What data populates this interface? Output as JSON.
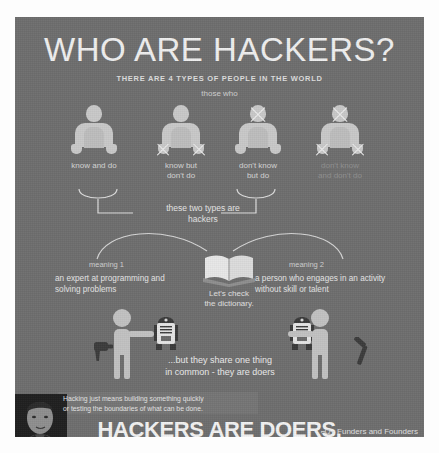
{
  "poster": {
    "background_color": "#6e6e6e",
    "text_color": "#e6e6e6",
    "title": "WHO ARE HACKERS?",
    "subtitle": "THERE ARE 4 TYPES OF PEOPLE IN THE WORLD",
    "intro": "those who"
  },
  "people": [
    {
      "label_line1": "know and do",
      "label_line2": "",
      "head_crossed": false,
      "hands_crossed": false,
      "dim": false
    },
    {
      "label_line1": "know but",
      "label_line2": "don't do",
      "head_crossed": false,
      "hands_crossed": true,
      "dim": false
    },
    {
      "label_line1": "don't know",
      "label_line2": "but do",
      "head_crossed": true,
      "hands_crossed": false,
      "dim": false
    },
    {
      "label_line1": "don't know",
      "label_line2": "and don't do",
      "head_crossed": true,
      "hands_crossed": true,
      "dim": true
    }
  ],
  "bracket": {
    "label_line1": "these two types are",
    "label_line2": "hackers"
  },
  "dictionary": {
    "caption_line1": "Let's check",
    "caption_line2": "the dictionary.",
    "meaning1_title": "meaning 1",
    "meaning1_body": "an expert at programming and solving problems",
    "meaning2_title": "meaning 2",
    "meaning2_body": "a person who engages in an activity without skill or talent"
  },
  "doers": {
    "line1": "...but they share one thing",
    "line2": "in common - they are doers",
    "left_tool": "drill-icon",
    "right_tool": "hammer-icon",
    "robot_icon": "robot-icon"
  },
  "footer": {
    "quote_line1": "Hacking just means building something quickly",
    "quote_line2": "or testing the boundaries of what can be done.",
    "headline": "HACKERS ARE DOERS.",
    "brand_mark": "⌐Ω¬",
    "brand_name": "Funders and Founders",
    "portrait": "portrait-photo"
  }
}
